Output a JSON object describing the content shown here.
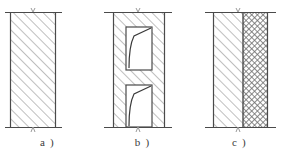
{
  "figure": {
    "type": "technical-cross-section-diagram",
    "width": 287,
    "height": 163,
    "background_color": "#ffffff",
    "line_color": "#4a4a4a",
    "hatch_color": "#8a8a8a",
    "crosshatch_color": "#7d7d7d"
  },
  "panels": [
    {
      "id": "a",
      "caption": "a )",
      "description": "solid single-layer wall section with 45-degree diagonal hatching",
      "block": {
        "x": 10,
        "y": 12,
        "width": 46,
        "height": 115
      },
      "top_rule": {
        "x1": 5,
        "x2": 62,
        "y": 12
      },
      "bottom_rule": {
        "x1": 5,
        "x2": 62,
        "y": 127
      },
      "tick_top": {
        "x": 33,
        "y": 12
      },
      "tick_bottom": {
        "x": 33,
        "y": 127
      },
      "fill": "diagonal-hatch",
      "openings": []
    },
    {
      "id": "b",
      "caption": "b )",
      "description": "wall section with two rectangular openings containing inclined crack lines",
      "block": {
        "x": 113,
        "y": 12,
        "width": 52,
        "height": 115
      },
      "top_rule": {
        "x1": 104,
        "x2": 172,
        "y": 12
      },
      "bottom_rule": {
        "x1": 104,
        "x2": 172,
        "y": 127
      },
      "tick_top": {
        "x": 138,
        "y": 12
      },
      "tick_bottom": {
        "x": 138,
        "y": 127
      },
      "fill": "diagonal-hatch",
      "openings": [
        {
          "x": 126,
          "y": 27,
          "width": 26,
          "height": 43,
          "curve": "upper-inclined-crack"
        },
        {
          "x": 126,
          "y": 85,
          "width": 26,
          "height": 42,
          "curve": "lower-inclined-crack"
        }
      ]
    },
    {
      "id": "c",
      "caption": "c )",
      "description": "two-layer composite wall: diagonal hatched layer plus cross-hatched insulation layer",
      "block": {
        "x": 213,
        "y": 12,
        "width": 55,
        "height": 115
      },
      "top_rule": {
        "x1": 205,
        "x2": 276,
        "y": 12
      },
      "bottom_rule": {
        "x1": 205,
        "x2": 276,
        "y": 127
      },
      "tick_top": {
        "x": 238,
        "y": 12
      },
      "tick_bottom": {
        "x": 238,
        "y": 127
      },
      "layers": [
        {
          "name": "structural-layer",
          "x": 213,
          "width": 30,
          "fill": "diagonal-hatch"
        },
        {
          "name": "insulation-layer",
          "x": 243,
          "width": 25,
          "fill": "cross-hatch"
        }
      ],
      "openings": []
    }
  ]
}
